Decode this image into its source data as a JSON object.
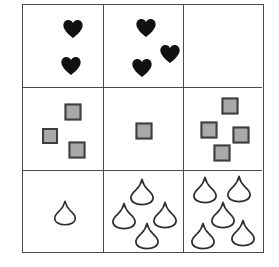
{
  "figure": {
    "kind": "matrix-reasoning-puzzle",
    "grid": {
      "rows": 3,
      "columns": 3
    },
    "colors": {
      "grid_line": "#4a4a4a",
      "background": "#ffffff",
      "heart_fill": "#111111",
      "square_fill": "#a9a9a9",
      "square_border": "#3d3d3d",
      "droplet_stroke": "#2f2f2f",
      "droplet_fill": "#ffffff"
    }
  },
  "cells": [
    {
      "id": "cell-r1c1",
      "row": 1,
      "column": 1,
      "shape": "heart",
      "icon_name": "heart-icon",
      "count": 2,
      "empty": false,
      "positions": [
        {
          "x": 50,
          "y": 24,
          "size": 21
        },
        {
          "x": 48,
          "y": 61,
          "size": 21
        }
      ]
    },
    {
      "id": "cell-r1c2",
      "row": 1,
      "column": 2,
      "shape": "heart",
      "icon_name": "heart-icon",
      "count": 3,
      "empty": false,
      "positions": [
        {
          "x": 42,
          "y": 23,
          "size": 21
        },
        {
          "x": 66,
          "y": 49,
          "size": 21
        },
        {
          "x": 38,
          "y": 63,
          "size": 21
        }
      ]
    },
    {
      "id": "cell-r1c3",
      "row": 1,
      "column": 3,
      "shape": "none",
      "icon_name": "empty-cell",
      "count": 0,
      "empty": true,
      "positions": []
    },
    {
      "id": "cell-r2c1",
      "row": 2,
      "column": 1,
      "shape": "square",
      "icon_name": "gray-square-icon",
      "count": 3,
      "empty": false,
      "positions": [
        {
          "x": 50,
          "y": 24,
          "size": 17
        },
        {
          "x": 27,
          "y": 48,
          "size": 16
        },
        {
          "x": 54,
          "y": 62,
          "size": 17
        }
      ]
    },
    {
      "id": "cell-r2c2",
      "row": 2,
      "column": 2,
      "shape": "square",
      "icon_name": "gray-square-icon",
      "count": 1,
      "empty": false,
      "positions": [
        {
          "x": 40,
          "y": 43,
          "size": 17
        }
      ]
    },
    {
      "id": "cell-r2c3",
      "row": 2,
      "column": 3,
      "shape": "square",
      "icon_name": "gray-square-icon",
      "count": 4,
      "empty": false,
      "positions": [
        {
          "x": 46,
          "y": 18,
          "size": 17
        },
        {
          "x": 25,
          "y": 42,
          "size": 17
        },
        {
          "x": 57,
          "y": 47,
          "size": 17
        },
        {
          "x": 38,
          "y": 65,
          "size": 17
        }
      ]
    },
    {
      "id": "cell-r3c1",
      "row": 3,
      "column": 1,
      "shape": "droplet",
      "icon_name": "droplet-icon",
      "count": 1,
      "empty": false,
      "positions": [
        {
          "x": 42,
          "y": 42,
          "size": 26
        }
      ]
    },
    {
      "id": "cell-r3c2",
      "row": 3,
      "column": 2,
      "shape": "droplet",
      "icon_name": "droplet-icon",
      "count": 4,
      "empty": false,
      "positions": [
        {
          "x": 38,
          "y": 21,
          "size": 28
        },
        {
          "x": 20,
          "y": 45,
          "size": 28
        },
        {
          "x": 61,
          "y": 44,
          "size": 28
        },
        {
          "x": 43,
          "y": 65,
          "size": 28
        }
      ]
    },
    {
      "id": "cell-r3c3",
      "row": 3,
      "column": 3,
      "shape": "droplet",
      "icon_name": "droplet-icon",
      "count": 5,
      "empty": false,
      "positions": [
        {
          "x": 21,
          "y": 19,
          "size": 28
        },
        {
          "x": 55,
          "y": 18,
          "size": 28
        },
        {
          "x": 39,
          "y": 44,
          "size": 28
        },
        {
          "x": 19,
          "y": 65,
          "size": 28
        },
        {
          "x": 59,
          "y": 62,
          "size": 28
        }
      ]
    }
  ]
}
